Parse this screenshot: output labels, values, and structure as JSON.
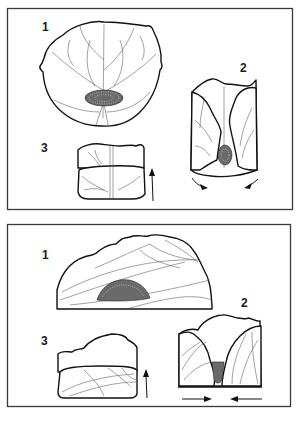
{
  "diagram": {
    "panels": [
      {
        "id": "top-panel",
        "steps": [
          {
            "label": "1",
            "description": "flat leaf with filling in center"
          },
          {
            "label": "2",
            "description": "sides folded in, arrows toward center"
          },
          {
            "label": "3",
            "description": "rolled up, arrow pointing up"
          }
        ]
      },
      {
        "id": "bottom-panel",
        "steps": [
          {
            "label": "1",
            "description": "half leaf with filling"
          },
          {
            "label": "2",
            "description": "sides pushed together, arrows inward"
          },
          {
            "label": "3",
            "description": "rolled up, arrow pointing up"
          }
        ]
      }
    ],
    "colors": {
      "line": "#111111",
      "frame": "#3a3a3a",
      "background": "#ffffff"
    }
  }
}
